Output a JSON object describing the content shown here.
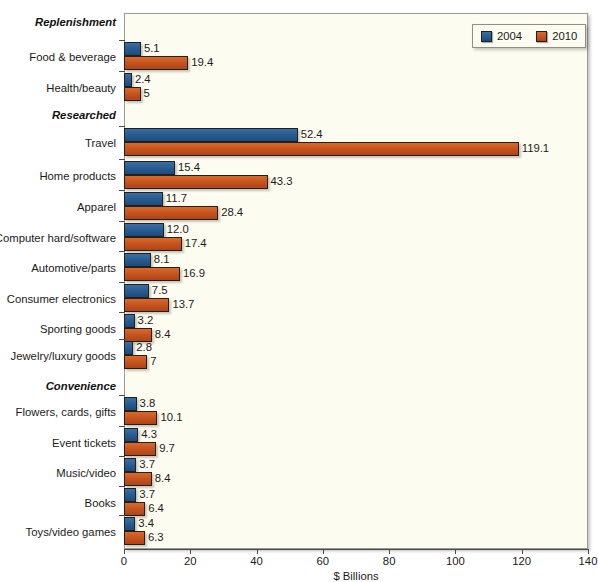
{
  "chart_data": {
    "type": "bar",
    "orientation": "horizontal",
    "title": "",
    "xlabel": "$ Billions",
    "ylabel": "",
    "xlim": [
      0,
      140
    ],
    "xticks": [
      0,
      20,
      40,
      60,
      80,
      100,
      120,
      140
    ],
    "grid": false,
    "legend_position": "top-right",
    "legend": [
      "2004",
      "2010"
    ],
    "series": [
      {
        "name": "2004",
        "color": "#2a5d92",
        "values": [
          5.1,
          2.4,
          52.4,
          15.4,
          11.7,
          12.0,
          8.1,
          7.5,
          3.2,
          2.8,
          3.8,
          4.3,
          3.7,
          3.7,
          3.4
        ]
      },
      {
        "name": "2010",
        "color": "#c8551f",
        "values": [
          19.4,
          5,
          119.1,
          43.3,
          28.4,
          17.4,
          16.9,
          13.7,
          8.4,
          7,
          10.1,
          9.7,
          8.4,
          6.4,
          6.3
        ]
      }
    ],
    "categories": [
      "Food & beverage",
      "Health/beauty",
      "Travel",
      "Home products",
      "Apparel",
      "Computer hard/software",
      "Automotive/parts",
      "Consumer electronics",
      "Sporting goods",
      "Jewelry/luxury goods",
      "Flowers, cards, gifts",
      "Event tickets",
      "Music/video",
      "Books",
      "Toys/video games"
    ],
    "value_labels": {
      "2004": [
        "5.1",
        "2.4",
        "52.4",
        "15.4",
        "11.7",
        "12.0",
        "8.1",
        "7.5",
        "3.2",
        "2.8",
        "3.8",
        "4.3",
        "3.7",
        "3.7",
        "3.4"
      ],
      "2010": [
        "19.4",
        "5",
        "119.1",
        "43.3",
        "28.4",
        "17.4",
        "16.9",
        "13.7",
        "8.4",
        "7",
        "10.1",
        "9.7",
        "8.4",
        "6.4",
        "6.3"
      ]
    },
    "groups": [
      {
        "label": "Replenishment",
        "start": 0,
        "count": 2
      },
      {
        "label": "Researched",
        "start": 2,
        "count": 8
      },
      {
        "label": "Convenience",
        "start": 10,
        "count": 5
      }
    ],
    "tick_labels": [
      "0",
      "20",
      "40",
      "60",
      "80",
      "100",
      "120",
      "140"
    ],
    "colors": {
      "series_2004": "#2a5d92",
      "series_2010": "#c8551f",
      "plot_background": "#fdfcf0",
      "page_background": "#ffffff",
      "axis": "#4a4a44"
    }
  }
}
